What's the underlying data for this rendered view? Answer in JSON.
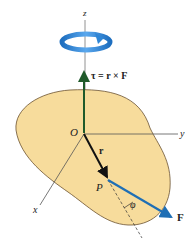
{
  "figure": {
    "axes": {
      "z": "z",
      "y": "y",
      "x": "x"
    },
    "origin_label": "O",
    "point_label": "P",
    "position_vector_label": "r",
    "force_label": "F",
    "angle_label": "φ",
    "torque_equation": "τ = r × F",
    "colors": {
      "body_fill": "#f7dc9c",
      "body_stroke": "#6b5230",
      "torque_vector": "#1f5a2a",
      "force_vector": "#1f6fb5",
      "rotation_arrow": "#2f86d6",
      "position_vector": "#111111",
      "axes": "#555555"
    }
  }
}
